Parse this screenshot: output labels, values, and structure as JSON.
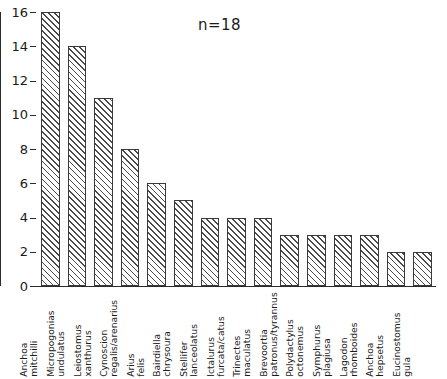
{
  "chart_data": {
    "type": "bar",
    "title": "",
    "subtitle": "",
    "xlabel": "",
    "ylabel": "",
    "ylim": [
      0,
      16
    ],
    "y_ticks": [
      0,
      2,
      4,
      6,
      8,
      10,
      12,
      14,
      16
    ],
    "grid": false,
    "legend": null,
    "annotations": [
      {
        "text": "n=18",
        "position": "top-center"
      }
    ],
    "categories": [
      "Anchoa mitchilli",
      "Micropogonias undulatus",
      "Leiostomus xanthurus",
      "Cynoscion regalis/arenarius",
      "Arius felis",
      "Bairdiella chrysoura",
      "Stellifer lanceolatus",
      "Ictalurus furcata/catus",
      "Trinectes maculatus",
      "Brevoortia patronus/tyrannus",
      "Polydactylus octonemus",
      "Symphurus plagiusa",
      "Lagodon rhomboides",
      "Anchoa hepsetus",
      "Eucinostomus gula"
    ],
    "category_lines": [
      [
        "Anchoa",
        "mitchilli"
      ],
      [
        "Micropogonias",
        "undulatus"
      ],
      [
        "Leiostomus",
        "xanthurus"
      ],
      [
        "Cynoscion",
        "regalis/arenarius"
      ],
      [
        "Arius",
        "felis"
      ],
      [
        "Bairdiella",
        "chrysoura"
      ],
      [
        "Stellifer",
        "lanceolatus"
      ],
      [
        "Ictalurus",
        "furcata/catus"
      ],
      [
        "Trinectes",
        "maculatus"
      ],
      [
        "Brevoortia",
        "patronus/tyrannus"
      ],
      [
        "Polydactylus",
        "octonemus"
      ],
      [
        "Symphurus",
        "plagiusa"
      ],
      [
        "Lagodon",
        "rhomboides"
      ],
      [
        "Anchoa",
        "hepsetus"
      ],
      [
        "Eucinostomus",
        "gula"
      ]
    ],
    "values": [
      16,
      14,
      11,
      8,
      6,
      5,
      4,
      4,
      4,
      3,
      3,
      3,
      3,
      2,
      2
    ],
    "bar_style": {
      "fill": "diagonal-hatch",
      "hatch_color": "#4a4a4a",
      "background": "#ffffff",
      "edge_color": "#3a3a3a"
    }
  },
  "axis": {
    "y_tick_labels": [
      "0",
      "2",
      "4",
      "6",
      "8",
      "10",
      "12",
      "14",
      "16"
    ]
  },
  "annotation": {
    "sample_size": "n=18"
  }
}
